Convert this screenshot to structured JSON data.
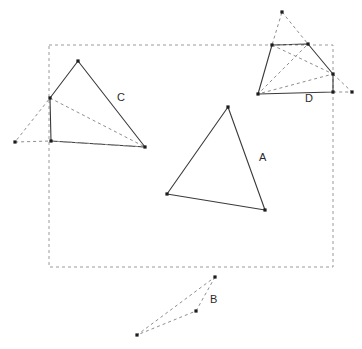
{
  "figure": {
    "title": "",
    "width": 362,
    "height": 349,
    "background_color": "#ffffff",
    "solid_stroke_color": "#3a3a3a",
    "dashed_stroke_color": "#8e8e8e",
    "vertex_color": "#1c1c1c",
    "bounding_box_color": "#9a9a9a"
  },
  "bounding_box": {
    "name": "dashed-bounding-box",
    "x": 49,
    "y": 45,
    "width": 284,
    "height": 222
  },
  "labels": [
    {
      "id": "A",
      "text": "A",
      "x": 259,
      "y": 161
    },
    {
      "id": "B",
      "text": "B",
      "x": 210,
      "y": 303
    },
    {
      "id": "C",
      "text": "C",
      "x": 117,
      "y": 101
    },
    {
      "id": "D",
      "text": "D",
      "x": 305,
      "y": 102
    }
  ],
  "shapes": [
    {
      "id": "A",
      "label": "A",
      "style": "solid",
      "closed": true,
      "points": [
        [
          228,
          107
        ],
        [
          265,
          210
        ],
        [
          167,
          194
        ]
      ],
      "vertices": [
        [
          228,
          107
        ],
        [
          265,
          210
        ],
        [
          167,
          194
        ]
      ]
    },
    {
      "id": "B",
      "label": "B",
      "style": "dashed",
      "closed": true,
      "points": [
        [
          215,
          277
        ],
        [
          196,
          311
        ],
        [
          137,
          335
        ]
      ],
      "vertices": [
        [
          215,
          277
        ],
        [
          196,
          311
        ],
        [
          137,
          335
        ]
      ]
    },
    {
      "id": "C",
      "label": "C",
      "style": "solid",
      "closed": true,
      "points": [
        [
          78,
          61
        ],
        [
          145,
          147
        ],
        [
          51,
          141
        ],
        [
          50,
          98
        ]
      ],
      "vertices": [
        [
          78,
          61
        ],
        [
          145,
          147
        ],
        [
          51,
          141
        ],
        [
          50,
          98
        ]
      ]
    },
    {
      "id": "C-dashed",
      "label": "",
      "style": "dashed",
      "closed": true,
      "points": [
        [
          50,
          98
        ],
        [
          145,
          147
        ],
        [
          51,
          141
        ],
        [
          15,
          142
        ]
      ],
      "vertices": [
        [
          15,
          142
        ]
      ]
    },
    {
      "id": "D",
      "label": "D",
      "style": "solid",
      "closed": true,
      "points": [
        [
          272,
          45
        ],
        [
          308,
          44
        ],
        [
          333,
          74
        ],
        [
          333,
          92
        ],
        [
          258,
          94
        ]
      ],
      "vertices": [
        [
          272,
          45
        ],
        [
          308,
          44
        ],
        [
          333,
          74
        ],
        [
          333,
          92
        ],
        [
          258,
          94
        ]
      ]
    },
    {
      "id": "D-dashed-apex",
      "label": "",
      "style": "dashed",
      "closed": true,
      "points": [
        [
          282,
          12
        ],
        [
          308,
          44
        ],
        [
          272,
          45
        ]
      ],
      "vertices": [
        [
          282,
          12
        ]
      ]
    },
    {
      "id": "D-dashed-inner",
      "label": "",
      "style": "dashed",
      "closed": false,
      "points": [
        [
          272,
          45
        ],
        [
          333,
          74
        ],
        [
          258,
          94
        ],
        [
          308,
          44
        ]
      ],
      "vertices": []
    },
    {
      "id": "D-dashed-tail",
      "label": "",
      "style": "dashed",
      "closed": false,
      "points": [
        [
          333,
          74
        ],
        [
          352,
          92
        ],
        [
          333,
          92
        ]
      ],
      "vertices": [
        [
          352,
          92
        ]
      ]
    }
  ]
}
